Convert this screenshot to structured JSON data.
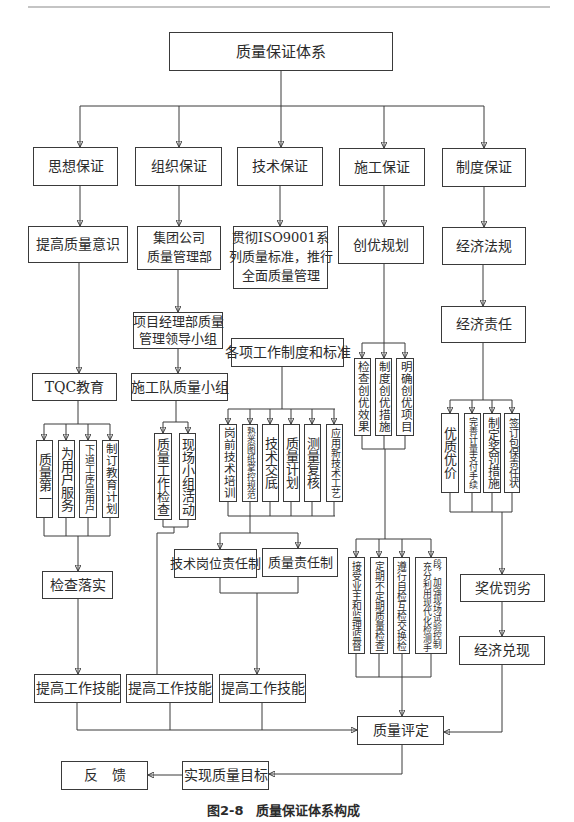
{
  "page": {
    "caption": "图2-8　质量保证体系构成"
  },
  "diagram": {
    "root": "质量保证体系",
    "thought": {
      "pillar": "思想保证",
      "awareness": "提高质量意识",
      "education": "TQC教育",
      "principles": [
        "质量第一",
        "为用户服务",
        "下道工序是用户",
        "制订教育计划"
      ],
      "check": "检查落实",
      "skill": "提高工作技能"
    },
    "organization": {
      "pillar": "组织保证",
      "department": [
        "集团公司",
        "质量管理部"
      ],
      "leadership_group": [
        "项目经理部质量",
        "管理领导小组"
      ],
      "team": "施工队质量小组",
      "activities": [
        "质量工作检查",
        "现场小组活动"
      ],
      "skill": "提高工作技能"
    },
    "technology": {
      "pillar": "技术保证",
      "standard": [
        "贯彻ISO9001系",
        "列质量标准，推行",
        "全面质量管理"
      ],
      "rules": "各项工作制度和标准",
      "items": [
        "岗前技术培训",
        "熟悉图纸掌控规范",
        "技术交底",
        "质量计划",
        "测量复核",
        "应用新技术工艺"
      ],
      "responsibilities": [
        "技术岗位责任制",
        "质量责任制"
      ],
      "skill": "提高工作技能"
    },
    "construction": {
      "pillar": "施工保证",
      "plan": "创优规划",
      "excellence": [
        "检查创优效果",
        "制度创优措施",
        "明确创优项目"
      ],
      "inspections": [
        "接受业主和监理监督",
        "定期不定期质量检查",
        "遵行自检互检交换检"
      ],
      "testing": [
        "充分利用现代化检测手",
        "段，加强现场试验控制"
      ]
    },
    "institution": {
      "pillar": "制度保证",
      "laws": "经济法规",
      "responsibility": "经济责任",
      "measures": [
        "优质优价",
        "完善计量支付手续",
        "制定奖罚措施",
        "签订包保责任状"
      ],
      "incentive": "奖优罚劣",
      "fulfillment": "经济兑现"
    },
    "evaluation": "质量评定",
    "goal": "实现质量目标",
    "feedback": "反　馈"
  }
}
